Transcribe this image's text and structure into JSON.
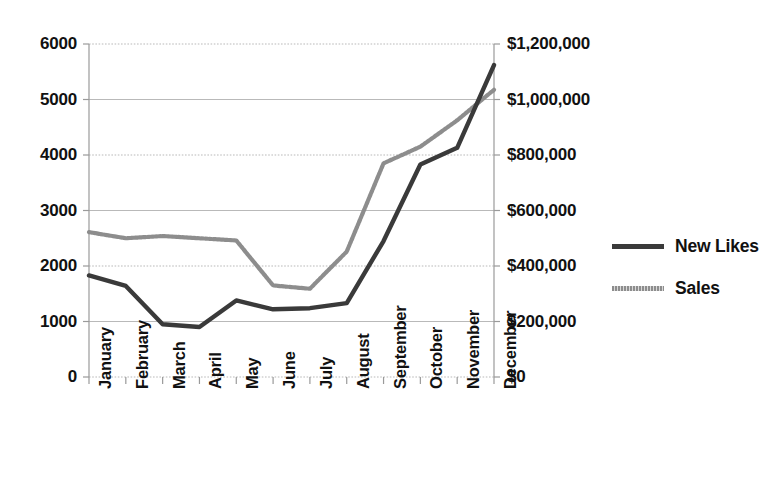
{
  "chart_data": {
    "type": "line",
    "title": "",
    "xlabel": "",
    "categories": [
      "January",
      "February",
      "March",
      "April",
      "May",
      "June",
      "July",
      "August",
      "September",
      "October",
      "November",
      "December"
    ],
    "grid": true,
    "legend_position": "right",
    "series": [
      {
        "name": "New Likes",
        "axis": "left",
        "color": "#3a3a3a",
        "style": "solid",
        "values": [
          1830,
          1640,
          950,
          900,
          1380,
          1220,
          1240,
          1330,
          2450,
          3830,
          4130,
          5620
        ]
      },
      {
        "name": "Sales",
        "axis": "right",
        "color": "#8d8d8d",
        "style": "dotted",
        "values": [
          522000,
          500000,
          508000,
          500000,
          492000,
          330000,
          318000,
          452000,
          770000,
          830000,
          925000,
          1035000
        ]
      }
    ],
    "y_left": {
      "label": "",
      "ticks": [
        0,
        1000,
        2000,
        3000,
        4000,
        5000,
        6000
      ],
      "tick_labels": [
        "0",
        "1000",
        "2000",
        "3000",
        "4000",
        "5000",
        "6000"
      ],
      "min": 0,
      "max": 6000
    },
    "y_right": {
      "label": "",
      "ticks": [
        0,
        200000,
        400000,
        600000,
        800000,
        1000000,
        1200000
      ],
      "tick_labels": [
        "$0",
        "$200,000",
        "$400,000",
        "$600,000",
        "$800,000",
        "$1,000,000",
        "$1,200,000"
      ],
      "min": 0,
      "max": 1200000
    },
    "legend": [
      "New Likes",
      "Sales"
    ],
    "colors": {
      "new_likes": "#3a3a3a",
      "sales": "#8d8d8d",
      "grid": "#b9b9b9",
      "axis": "#9a9a9a",
      "background": "#ffffff"
    }
  }
}
